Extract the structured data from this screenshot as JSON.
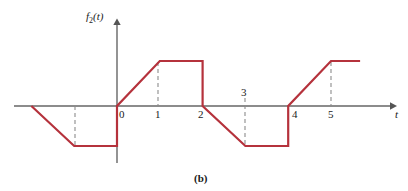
{
  "figure": {
    "caption": "(b)",
    "background": "#ffffff"
  },
  "axes": {
    "y_label_base": "f",
    "y_label_sub": "2",
    "y_label_arg": "(t)",
    "x_label": "t",
    "axis_color": "#666666"
  },
  "ticks": {
    "t0": "0",
    "t1": "1",
    "t2": "2",
    "t3": "3",
    "t4": "4",
    "t5": "5"
  },
  "chart_data": {
    "type": "line",
    "title": "(b)",
    "xlabel": "t",
    "ylabel": "f2(t)",
    "series": [
      {
        "name": "f2(t)",
        "color": "#b5323c",
        "linewidth_px": 2.2,
        "points": [
          {
            "t": -2.0,
            "y": 0
          },
          {
            "t": -1.0,
            "y": -0.889
          },
          {
            "t": 0.0,
            "y": -0.889
          },
          {
            "t": 0.0,
            "y": 0
          },
          {
            "t": 1.0,
            "y": 1.0
          },
          {
            "t": 2.0,
            "y": 1.0
          },
          {
            "t": 2.0,
            "y": 0
          },
          {
            "t": 3.0,
            "y": -0.889
          },
          {
            "t": 4.0,
            "y": -0.889
          },
          {
            "t": 4.0,
            "y": 0
          },
          {
            "t": 5.0,
            "y": 1.0
          },
          {
            "t": 5.68,
            "y": 1.0
          }
        ]
      }
    ],
    "xlim": [
      -2.4,
      6.45
    ],
    "ylim": [
      -1.27,
      1.0
    ],
    "xticks": [
      0,
      1,
      2,
      3,
      4,
      5
    ],
    "guide_lines_at": [
      -1,
      1,
      3,
      5
    ],
    "grid": false,
    "legend": false,
    "annotations": [
      {
        "text": "peak amplitude held flat between t=1 and t=2"
      },
      {
        "text": "trough amplitude held flat between t=3 and t=4"
      },
      {
        "text": "tick label 3 drawn above the axis, others below"
      }
    ]
  },
  "geometry": {
    "axis_y_px": 106,
    "axis_x_px": 117,
    "unit_px": 42.8,
    "peak_y_px": 61,
    "trough_y_px": 146
  },
  "colors": {
    "waveform": "#b5323c",
    "axis": "#666666",
    "dash": "#8c8c8c",
    "text": "#1a1a1a"
  }
}
